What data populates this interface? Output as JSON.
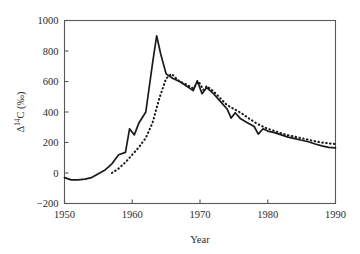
{
  "chart_data": {
    "type": "line",
    "title": "",
    "xlabel": "Year",
    "ylabel": "Δ14C (‰)",
    "ylabel_display": "Δ",
    "ylabel_sup": "14",
    "ylabel_tail": "C (‰)",
    "xlim": [
      1950,
      1990
    ],
    "ylim": [
      -200,
      1000
    ],
    "xticks": [
      1950,
      1960,
      1970,
      1980,
      1990
    ],
    "xticklabels": [
      "1950",
      "1960",
      "1970",
      "1980",
      "1990"
    ],
    "yticks": [
      -200,
      0,
      200,
      400,
      600,
      800,
      1000
    ],
    "yticklabels": [
      "−200",
      "0",
      "200",
      "400",
      "600",
      "800",
      "1000"
    ],
    "grid": false,
    "legend": "none",
    "series": [
      {
        "name": "Northern Hemisphere (solid)",
        "style": "solid",
        "color": "#1a1a1a",
        "x": [
          1950,
          1951,
          1952,
          1953,
          1954,
          1955,
          1956,
          1957,
          1958,
          1959,
          1959.6,
          1960.3,
          1961,
          1962,
          1963,
          1963.6,
          1964.2,
          1965,
          1966,
          1967,
          1968,
          1969,
          1969.6,
          1970.3,
          1971,
          1972,
          1973,
          1974,
          1974.6,
          1975.2,
          1976,
          1977,
          1978,
          1978.6,
          1979.3,
          1980,
          1981,
          1982,
          1983,
          1984,
          1985,
          1986,
          1987,
          1988,
          1989,
          1990
        ],
        "y": [
          -30,
          -45,
          -45,
          -40,
          -30,
          -5,
          20,
          60,
          120,
          135,
          290,
          250,
          330,
          400,
          720,
          900,
          780,
          650,
          620,
          600,
          570,
          540,
          605,
          520,
          560,
          520,
          470,
          420,
          360,
          395,
          355,
          330,
          305,
          255,
          290,
          275,
          265,
          250,
          235,
          225,
          215,
          205,
          190,
          178,
          168,
          165
        ]
      },
      {
        "name": "Southern Hemisphere (dotted)",
        "style": "dotted",
        "color": "#1a1a1a",
        "x": [
          1957,
          1958,
          1959,
          1960,
          1961,
          1962,
          1963,
          1964,
          1965,
          1965.8,
          1966.5,
          1967,
          1968,
          1969,
          1969.8,
          1970.5,
          1971,
          1972,
          1973,
          1974,
          1975,
          1976,
          1977,
          1978,
          1979,
          1980,
          1981,
          1982,
          1983,
          1984,
          1985,
          1986,
          1987,
          1988,
          1989,
          1990
        ],
        "y": [
          0,
          30,
          70,
          120,
          170,
          230,
          330,
          490,
          620,
          650,
          620,
          600,
          580,
          555,
          600,
          545,
          570,
          535,
          490,
          445,
          420,
          395,
          365,
          335,
          310,
          290,
          275,
          260,
          248,
          238,
          228,
          218,
          208,
          200,
          194,
          190
        ]
      }
    ]
  }
}
